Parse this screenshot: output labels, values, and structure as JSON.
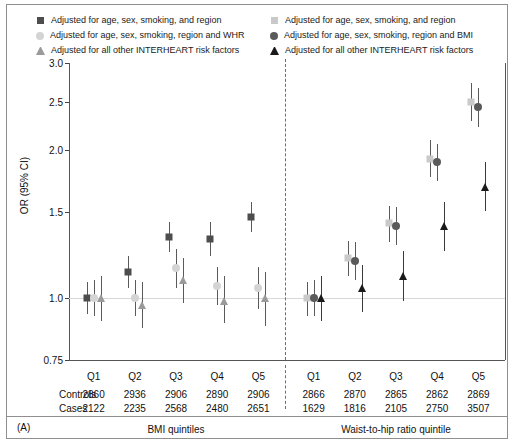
{
  "legend": {
    "left_column": [
      {
        "marker": "square-marker",
        "color": "#4d4d4d",
        "label": "Adjusted for age, sex, smoking, and region"
      },
      {
        "marker": "circle-marker",
        "color": "#d4d4d4",
        "label": "Adjusted for age, sex, smoking, region and WHR"
      },
      {
        "marker": "triangle-marker",
        "color": "#9a9a9a",
        "label": "Adjusted for all other INTERHEART risk factors"
      }
    ],
    "right_column": [
      {
        "marker": "square-marker",
        "color": "#c9c9c9",
        "label": "Adjusted for age, sex, smoking, and region"
      },
      {
        "marker": "circle-marker",
        "color": "#5a5a5a",
        "label": "Adjusted for age, sex, smoking, region and BMI"
      },
      {
        "marker": "triangle-marker",
        "color": "#1a1a1a",
        "label": "Adjusted for all other INTERHEART risk factors"
      }
    ]
  },
  "axis": {
    "ylabel": "OR (95% CI)",
    "yticks": [
      "3.0",
      "2.5",
      "2.0",
      "1.5",
      "1.0",
      "0.75"
    ],
    "reference_value": "1.0"
  },
  "panels": [
    {
      "id": "bmi",
      "title": "BMI quintiles"
    },
    {
      "id": "whr",
      "title": "Waist-to-hip ratio quintile"
    }
  ],
  "table": {
    "row_labels": [
      "Controls",
      "Cases"
    ],
    "bmi": {
      "quintiles": [
        "Q1",
        "Q2",
        "Q3",
        "Q4",
        "Q5"
      ],
      "controls": [
        "2860",
        "2936",
        "2906",
        "2890",
        "2906"
      ],
      "cases": [
        "2122",
        "2235",
        "2568",
        "2480",
        "2651"
      ]
    },
    "whr": {
      "quintiles": [
        "Q1",
        "Q2",
        "Q3",
        "Q4",
        "Q5"
      ],
      "controls": [
        "2866",
        "2870",
        "2865",
        "2862",
        "2869"
      ],
      "cases": [
        "1629",
        "1816",
        "2105",
        "2750",
        "3507"
      ]
    }
  },
  "figure_tag": "(A)",
  "chart_data": {
    "type": "scatter",
    "title": "",
    "xlabel": "",
    "ylabel": "OR (95% CI)",
    "yscale": "log",
    "ylim": [
      0.75,
      3.0
    ],
    "yticks": [
      0.75,
      1.0,
      1.5,
      2.0,
      2.5,
      3.0
    ],
    "grid": false,
    "reference_line": 1.0,
    "legend_position": "top",
    "panels": [
      {
        "name": "BMI quintiles",
        "categories": [
          "Q1",
          "Q2",
          "Q3",
          "Q4",
          "Q5"
        ],
        "series": [
          {
            "name": "Adjusted for age, sex, smoking, and region",
            "marker": "square",
            "color": "#4d4d4d",
            "values": [
              1.0,
              1.13,
              1.33,
              1.32,
              1.46
            ],
            "ci_low": [
              0.93,
              1.05,
              1.24,
              1.22,
              1.36
            ],
            "ci_high": [
              1.08,
              1.22,
              1.43,
              1.43,
              1.57
            ]
          },
          {
            "name": "Adjusted for age, sex, smoking, region and WHR",
            "marker": "circle",
            "color": "#d4d4d4",
            "values": [
              1.0,
              1.0,
              1.15,
              1.06,
              1.05
            ],
            "ci_low": [
              0.92,
              0.92,
              1.05,
              0.97,
              0.95
            ],
            "ci_high": [
              1.09,
              1.09,
              1.26,
              1.16,
              1.16
            ]
          },
          {
            "name": "Adjusted for all other INTERHEART risk factors",
            "marker": "triangle",
            "color": "#9a9a9a",
            "values": [
              1.0,
              0.97,
              1.09,
              0.99,
              1.0
            ],
            "ci_low": [
              0.9,
              0.87,
              0.98,
              0.89,
              0.88
            ],
            "ci_high": [
              1.11,
              1.08,
              1.21,
              1.11,
              1.13
            ]
          }
        ],
        "controls": [
          2860,
          2936,
          2906,
          2890,
          2906
        ],
        "cases": [
          2122,
          2235,
          2568,
          2480,
          2651
        ]
      },
      {
        "name": "Waist-to-hip ratio quintile",
        "categories": [
          "Q1",
          "Q2",
          "Q3",
          "Q4",
          "Q5"
        ],
        "series": [
          {
            "name": "Adjusted for age, sex, smoking, and region",
            "marker": "square",
            "color": "#c9c9c9",
            "values": [
              1.0,
              1.21,
              1.42,
              1.92,
              2.5
            ],
            "ci_low": [
              0.92,
              1.11,
              1.3,
              1.76,
              2.29
            ],
            "ci_high": [
              1.08,
              1.31,
              1.54,
              2.09,
              2.73
            ]
          },
          {
            "name": "Adjusted for age, sex, smoking, region and BMI",
            "marker": "circle",
            "color": "#5a5a5a",
            "values": [
              1.0,
              1.19,
              1.4,
              1.89,
              2.44
            ],
            "ci_low": [
              0.92,
              1.09,
              1.28,
              1.73,
              2.23
            ],
            "ci_high": [
              1.09,
              1.3,
              1.53,
              2.06,
              2.67
            ]
          },
          {
            "name": "Adjusted for all other INTERHEART risk factors",
            "marker": "triangle",
            "color": "#1a1a1a",
            "values": [
              1.0,
              1.05,
              1.11,
              1.4,
              1.68
            ],
            "ci_low": [
              0.9,
              0.94,
              0.99,
              1.25,
              1.5
            ],
            "ci_high": [
              1.11,
              1.17,
              1.25,
              1.57,
              1.89
            ]
          }
        ],
        "controls": [
          2866,
          2870,
          2865,
          2862,
          2869
        ],
        "cases": [
          1629,
          1816,
          2105,
          2750,
          3507
        ]
      }
    ]
  }
}
